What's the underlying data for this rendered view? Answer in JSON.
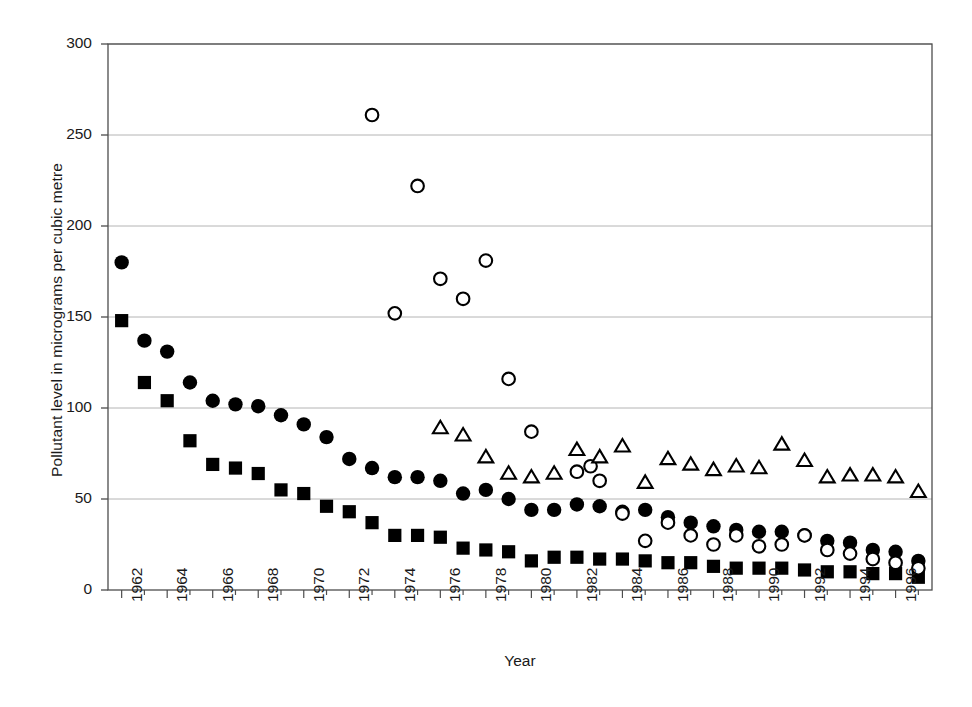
{
  "chart_data": {
    "type": "scatter",
    "title": "",
    "xlabel": "Year",
    "ylabel": "Pollutant level in micrograms per cubic metre",
    "xlim": [
      1961.4,
      1997.6
    ],
    "ylim": [
      0,
      300
    ],
    "ytick_values": [
      0,
      50,
      100,
      150,
      200,
      250,
      300
    ],
    "ytick_labels": [
      "0",
      "50",
      "100",
      "150",
      "200",
      "250",
      "300"
    ],
    "xtick_values": [
      1962,
      1964,
      1966,
      1968,
      1970,
      1972,
      1974,
      1976,
      1978,
      1980,
      1982,
      1984,
      1986,
      1988,
      1990,
      1992,
      1994,
      1996
    ],
    "xtick_labels": [
      "1962",
      "1964",
      "1966",
      "1968",
      "1970",
      "1972",
      "1974",
      "1976",
      "1978",
      "1980",
      "1982",
      "1984",
      "1986",
      "1988",
      "1990",
      "1992",
      "1994",
      "1996"
    ],
    "minor_xticks": true,
    "grid": "horizontal",
    "grid_color": "#b4b4b4",
    "frame": true,
    "legend": "none",
    "marker_color": "#000000",
    "series": [
      {
        "name": "filled-circle",
        "marker": "circle-filled",
        "points": [
          {
            "x": 1962,
            "y": 180
          },
          {
            "x": 1963,
            "y": 137
          },
          {
            "x": 1964,
            "y": 131
          },
          {
            "x": 1965,
            "y": 114
          },
          {
            "x": 1966,
            "y": 104
          },
          {
            "x": 1967,
            "y": 102
          },
          {
            "x": 1968,
            "y": 101
          },
          {
            "x": 1969,
            "y": 96
          },
          {
            "x": 1970,
            "y": 91
          },
          {
            "x": 1971,
            "y": 84
          },
          {
            "x": 1972,
            "y": 72
          },
          {
            "x": 1973,
            "y": 67
          },
          {
            "x": 1974,
            "y": 62
          },
          {
            "x": 1975,
            "y": 62
          },
          {
            "x": 1976,
            "y": 60
          },
          {
            "x": 1977,
            "y": 53
          },
          {
            "x": 1978,
            "y": 55
          },
          {
            "x": 1979,
            "y": 50
          },
          {
            "x": 1980,
            "y": 44
          },
          {
            "x": 1981,
            "y": 44
          },
          {
            "x": 1982,
            "y": 47
          },
          {
            "x": 1983,
            "y": 46
          },
          {
            "x": 1984,
            "y": 43
          },
          {
            "x": 1985,
            "y": 44
          },
          {
            "x": 1986,
            "y": 40
          },
          {
            "x": 1987,
            "y": 37
          },
          {
            "x": 1988,
            "y": 35
          },
          {
            "x": 1989,
            "y": 33
          },
          {
            "x": 1990,
            "y": 32
          },
          {
            "x": 1991,
            "y": 32
          },
          {
            "x": 1992,
            "y": 30
          },
          {
            "x": 1993,
            "y": 27
          },
          {
            "x": 1994,
            "y": 26
          },
          {
            "x": 1995,
            "y": 22
          },
          {
            "x": 1996,
            "y": 21
          },
          {
            "x": 1997,
            "y": 16
          }
        ]
      },
      {
        "name": "filled-square",
        "marker": "square-filled",
        "points": [
          {
            "x": 1962,
            "y": 148
          },
          {
            "x": 1963,
            "y": 114
          },
          {
            "x": 1964,
            "y": 104
          },
          {
            "x": 1965,
            "y": 82
          },
          {
            "x": 1966,
            "y": 69
          },
          {
            "x": 1967,
            "y": 67
          },
          {
            "x": 1968,
            "y": 64
          },
          {
            "x": 1969,
            "y": 55
          },
          {
            "x": 1970,
            "y": 53
          },
          {
            "x": 1971,
            "y": 46
          },
          {
            "x": 1972,
            "y": 43
          },
          {
            "x": 1973,
            "y": 37
          },
          {
            "x": 1974,
            "y": 30
          },
          {
            "x": 1975,
            "y": 30
          },
          {
            "x": 1976,
            "y": 29
          },
          {
            "x": 1977,
            "y": 23
          },
          {
            "x": 1978,
            "y": 22
          },
          {
            "x": 1979,
            "y": 21
          },
          {
            "x": 1980,
            "y": 16
          },
          {
            "x": 1981,
            "y": 18
          },
          {
            "x": 1982,
            "y": 18
          },
          {
            "x": 1983,
            "y": 17
          },
          {
            "x": 1984,
            "y": 17
          },
          {
            "x": 1985,
            "y": 16
          },
          {
            "x": 1986,
            "y": 15
          },
          {
            "x": 1987,
            "y": 15
          },
          {
            "x": 1988,
            "y": 13
          },
          {
            "x": 1989,
            "y": 12
          },
          {
            "x": 1990,
            "y": 12
          },
          {
            "x": 1991,
            "y": 12
          },
          {
            "x": 1992,
            "y": 11
          },
          {
            "x": 1993,
            "y": 10
          },
          {
            "x": 1994,
            "y": 10
          },
          {
            "x": 1995,
            "y": 9
          },
          {
            "x": 1996,
            "y": 9
          },
          {
            "x": 1997,
            "y": 7
          }
        ]
      },
      {
        "name": "open-circle",
        "marker": "circle-open",
        "points": [
          {
            "x": 1973,
            "y": 261
          },
          {
            "x": 1974,
            "y": 152
          },
          {
            "x": 1975,
            "y": 222
          },
          {
            "x": 1976,
            "y": 171
          },
          {
            "x": 1977,
            "y": 160
          },
          {
            "x": 1978,
            "y": 181
          },
          {
            "x": 1979,
            "y": 116
          },
          {
            "x": 1980,
            "y": 87
          },
          {
            "x": 1982,
            "y": 65
          },
          {
            "x": 1982.6,
            "y": 68
          },
          {
            "x": 1983,
            "y": 60
          },
          {
            "x": 1984,
            "y": 42
          },
          {
            "x": 1985,
            "y": 27
          },
          {
            "x": 1986,
            "y": 37
          },
          {
            "x": 1987,
            "y": 30
          },
          {
            "x": 1988,
            "y": 25
          },
          {
            "x": 1989,
            "y": 30
          },
          {
            "x": 1990,
            "y": 24
          },
          {
            "x": 1991,
            "y": 25
          },
          {
            "x": 1992,
            "y": 30
          },
          {
            "x": 1993,
            "y": 22
          },
          {
            "x": 1994,
            "y": 20
          },
          {
            "x": 1995,
            "y": 17
          },
          {
            "x": 1996,
            "y": 15
          },
          {
            "x": 1997,
            "y": 12
          }
        ]
      },
      {
        "name": "open-triangle",
        "marker": "triangle-open",
        "points": [
          {
            "x": 1976,
            "y": 89
          },
          {
            "x": 1977,
            "y": 85
          },
          {
            "x": 1978,
            "y": 73
          },
          {
            "x": 1979,
            "y": 64
          },
          {
            "x": 1980,
            "y": 62
          },
          {
            "x": 1981,
            "y": 64
          },
          {
            "x": 1982,
            "y": 77
          },
          {
            "x": 1983,
            "y": 73
          },
          {
            "x": 1984,
            "y": 79
          },
          {
            "x": 1985,
            "y": 59
          },
          {
            "x": 1986,
            "y": 72
          },
          {
            "x": 1987,
            "y": 69
          },
          {
            "x": 1988,
            "y": 66
          },
          {
            "x": 1989,
            "y": 68
          },
          {
            "x": 1990,
            "y": 67
          },
          {
            "x": 1991,
            "y": 80
          },
          {
            "x": 1992,
            "y": 71
          },
          {
            "x": 1993,
            "y": 62
          },
          {
            "x": 1994,
            "y": 63
          },
          {
            "x": 1995,
            "y": 63
          },
          {
            "x": 1996,
            "y": 62
          },
          {
            "x": 1997,
            "y": 54
          }
        ]
      }
    ]
  }
}
